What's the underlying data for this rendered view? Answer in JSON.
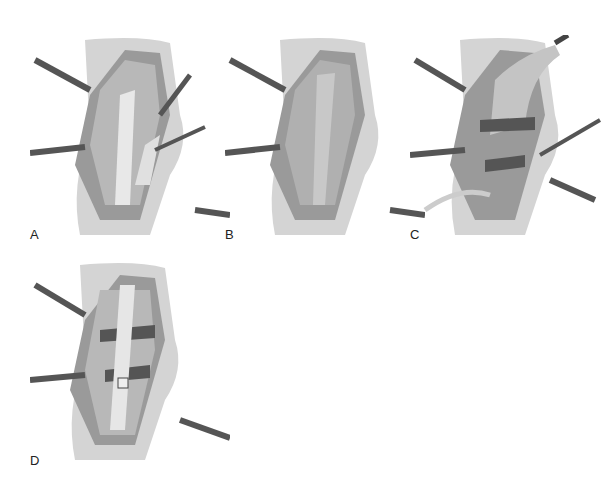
{
  "figure": {
    "panels": [
      {
        "label": "A",
        "description": "Surgical exposure with retractors; tendon graft being harvested with clamp"
      },
      {
        "label": "B",
        "description": "Exposed muscle bed after graft harvest"
      },
      {
        "label": "C",
        "description": "Graft passed through tunnels with clamps and tubing"
      },
      {
        "label": "D",
        "description": "Graft secured with fixation plate"
      }
    ]
  }
}
